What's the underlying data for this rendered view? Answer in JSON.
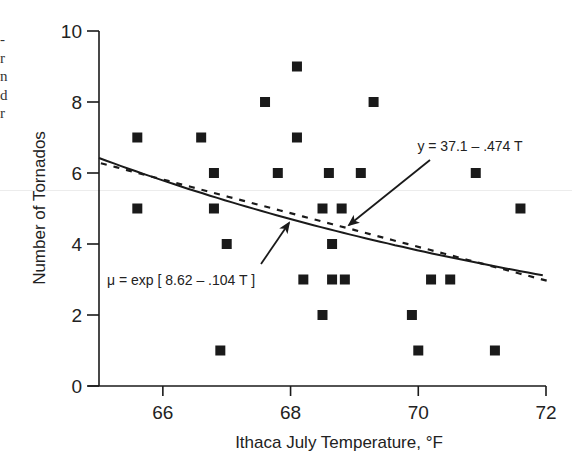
{
  "chart_data": {
    "type": "scatter",
    "title": "",
    "xlabel": "Ithaca July Temperature, °F",
    "ylabel": "Number of Tornados",
    "xlim": [
      65,
      72
    ],
    "ylim": [
      0,
      10
    ],
    "x_ticks": [
      66,
      68,
      70,
      72
    ],
    "y_ticks": [
      0,
      2,
      4,
      6,
      8,
      10
    ],
    "grid": false,
    "legend": null,
    "points": [
      {
        "x": 65.6,
        "y": 7
      },
      {
        "x": 65.6,
        "y": 5
      },
      {
        "x": 66.6,
        "y": 7
      },
      {
        "x": 66.8,
        "y": 6
      },
      {
        "x": 66.8,
        "y": 5
      },
      {
        "x": 66.9,
        "y": 1
      },
      {
        "x": 67.0,
        "y": 4
      },
      {
        "x": 67.6,
        "y": 8
      },
      {
        "x": 67.8,
        "y": 6
      },
      {
        "x": 68.1,
        "y": 9
      },
      {
        "x": 68.1,
        "y": 7
      },
      {
        "x": 68.2,
        "y": 3
      },
      {
        "x": 68.5,
        "y": 5
      },
      {
        "x": 68.5,
        "y": 2
      },
      {
        "x": 68.6,
        "y": 6
      },
      {
        "x": 68.65,
        "y": 4
      },
      {
        "x": 68.65,
        "y": 3
      },
      {
        "x": 68.8,
        "y": 5
      },
      {
        "x": 68.85,
        "y": 3
      },
      {
        "x": 69.1,
        "y": 6
      },
      {
        "x": 69.3,
        "y": 8
      },
      {
        "x": 69.9,
        "y": 2
      },
      {
        "x": 70.0,
        "y": 1
      },
      {
        "x": 70.2,
        "y": 3
      },
      {
        "x": 70.5,
        "y": 3
      },
      {
        "x": 70.9,
        "y": 6
      },
      {
        "x": 71.2,
        "y": 1
      },
      {
        "x": 71.6,
        "y": 5
      }
    ],
    "series": [
      {
        "name": "Poisson regression",
        "style": "solid",
        "equation": "μ = exp [ 8.62 – .104 T ]",
        "intercept": 8.62,
        "slope": -0.104,
        "link": "log"
      },
      {
        "name": "Linear regression",
        "style": "dashed",
        "equation": "y = 37.1 – .474 T",
        "intercept": 37.1,
        "slope": -0.474,
        "link": "identity"
      }
    ],
    "annotations": [
      {
        "text": "y = 37.1 – .474 T",
        "points_to": "dashed line"
      },
      {
        "text": "μ = exp [ 8.62 – .104 T ]",
        "points_to": "solid line"
      }
    ]
  },
  "labels": {
    "xlabel": "Ithaca July Temperature, °F",
    "ylabel": "Number of Tornados",
    "x_ticks": [
      "66",
      "68",
      "70",
      "72"
    ],
    "y_ticks": [
      "0",
      "2",
      "4",
      "6",
      "8",
      "10"
    ],
    "annot_linear": "y = 37.1 – .474 T",
    "annot_poisson": "μ = exp [ 8.62 – .104 T ]"
  },
  "colors": {
    "ink": "#1a1a1a",
    "marker": "#1a1a1a",
    "background": "#ffffff"
  }
}
